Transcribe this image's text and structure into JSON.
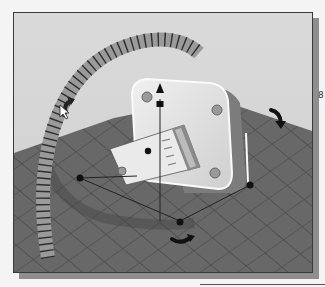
{
  "scene": {
    "type": "3d-viewport",
    "description": "Rotation manipulator on a box part with a tilted bracket over a grid floor",
    "colors": {
      "background": "#d6d6d6",
      "floor": "#6e6e6e",
      "grid_line": "#4a4a4a",
      "ring": "#9a9a9a",
      "ring_tick": "#333333",
      "box_face": "#e2e2e2",
      "box_side": "#7c7c7c",
      "bracket": "#ececec",
      "handle": "#111111",
      "frame_shadow": "#8e8e8e"
    },
    "handles": {
      "rotate_left": "rotate-arrow-left",
      "rotate_right": "rotate-arrow-right",
      "rotate_bottom": "rotate-arrow-bottom",
      "translate_up": "arrow-up"
    }
  },
  "margin": {
    "glyph": "8"
  }
}
